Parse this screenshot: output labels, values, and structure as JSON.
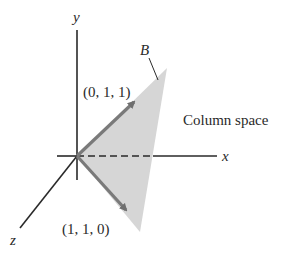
{
  "figure": {
    "colors": {
      "axis": "#2a2a2a",
      "plane_fill": "#d6d6d6",
      "vector": "#7a7a7a",
      "text": "#2a2a2a"
    },
    "axes": {
      "x_label": "x",
      "y_label": "y",
      "z_label": "z"
    },
    "vectors": [
      {
        "label": "(0, 1, 1)",
        "components": [
          0,
          1,
          1
        ]
      },
      {
        "label": "(1, 1, 0)",
        "components": [
          1,
          1,
          0
        ]
      }
    ],
    "plane_label": "B",
    "region_label": "Column space"
  }
}
